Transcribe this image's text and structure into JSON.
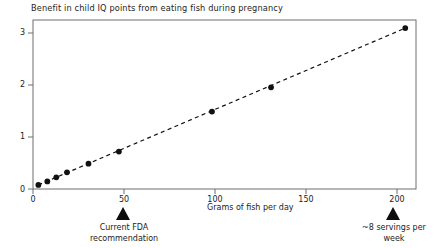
{
  "chart_data": {
    "type": "scatter",
    "title": "Benefit in child IQ points from eating fish during pregnancy",
    "xlabel": "Grams of fish per day",
    "ylabel": "",
    "xlim": [
      -3,
      211
    ],
    "ylim": [
      -0.06,
      3.28
    ],
    "xticks": [
      0,
      50,
      100,
      150,
      200
    ],
    "xticklabels": [
      "0",
      "50",
      "100",
      "150",
      "200"
    ],
    "yticks": [
      0,
      1,
      2,
      3
    ],
    "yticklabels": [
      "0",
      "1",
      "2",
      "3"
    ],
    "grid": false,
    "legend": false,
    "marker": "filled-circle",
    "marker_color": "#111111",
    "points": [
      {
        "x": 0,
        "y": 0.02
      },
      {
        "x": 5,
        "y": 0.09
      },
      {
        "x": 10,
        "y": 0.17
      },
      {
        "x": 16,
        "y": 0.27
      },
      {
        "x": 28,
        "y": 0.44
      },
      {
        "x": 45,
        "y": 0.68
      },
      {
        "x": 97,
        "y": 1.47
      },
      {
        "x": 130,
        "y": 1.95
      },
      {
        "x": 205,
        "y": 3.12
      }
    ],
    "series": [
      {
        "name": "IQ benefit",
        "x": [
          0,
          5,
          10,
          16,
          28,
          45,
          97,
          130,
          205
        ],
        "values": [
          0.02,
          0.09,
          0.17,
          0.27,
          0.44,
          0.68,
          1.47,
          1.95,
          3.12
        ]
      }
    ],
    "trendline": {
      "style": "dashed",
      "color": "#111111",
      "x_start": 0,
      "y_start": 0.02,
      "x_end": 205,
      "y_end": 3.12
    },
    "annotations": [
      {
        "id": "fda-recommendation",
        "marker": "up-triangle",
        "x": 48,
        "lines": [
          "Current FDA",
          "recommendation"
        ]
      },
      {
        "id": "eight-servings",
        "marker": "up-triangle",
        "x": 198,
        "lines": [
          "~8 servings per",
          "week"
        ]
      }
    ]
  },
  "axis": {
    "frame_color": "#6f6f6f",
    "tick_color": "#6f6f6f"
  }
}
